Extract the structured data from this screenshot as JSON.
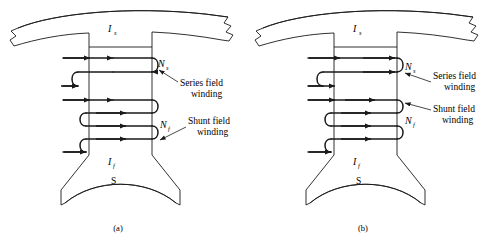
{
  "figure": {
    "type": "technical-diagram",
    "background_color": "#ffffff",
    "line_color": "#1a1a1a"
  },
  "panels": [
    {
      "id": "a",
      "caption": "(a)",
      "caption_x": 118,
      "caption_y": 231,
      "origin_x": 0,
      "labels": {
        "current_top": "I",
        "current_top_sub": "s",
        "current_bottom": "I",
        "current_bottom_sub": "f",
        "pole_letter": "S",
        "turns_series": "N",
        "turns_series_sub": "s",
        "turns_shunt": "N",
        "turns_shunt_sub": "f",
        "series_winding_line1": "Series field",
        "series_winding_line2": "winding",
        "shunt_winding_line1": "Shunt field",
        "shunt_winding_line2": "winding"
      },
      "arrow_directions": {
        "series_coils": [
          "right",
          "right"
        ],
        "series_leads": [
          "right",
          "left"
        ],
        "shunt_coils": [
          "right",
          "right",
          "right",
          "right"
        ],
        "shunt_leads": [
          "right",
          "left"
        ]
      }
    },
    {
      "id": "b",
      "caption": "(b)",
      "caption_x": 363,
      "caption_y": 231,
      "origin_x": 245,
      "labels": {
        "current_top": "I",
        "current_top_sub": "s",
        "current_bottom": "I",
        "current_bottom_sub": "f",
        "pole_letter": "S",
        "turns_series": "N",
        "turns_series_sub": "s",
        "turns_shunt": "N",
        "turns_shunt_sub": "f",
        "series_winding_line1": "Series field",
        "series_winding_line2": "winding",
        "shunt_winding_line1": "Shunt field",
        "shunt_winding_line2": "winding"
      },
      "arrow_directions": {
        "series_coils": [
          "left",
          "left"
        ],
        "series_leads": [
          "left",
          "right"
        ],
        "shunt_coils": [
          "right",
          "right",
          "right",
          "right"
        ],
        "shunt_leads": [
          "right",
          "left"
        ]
      }
    }
  ],
  "geometry": {
    "pole_left_x": 89,
    "pole_right_x": 152,
    "pole_top_y": 47,
    "pole_flare_y": 155,
    "shoe_bottom_y": 205,
    "coil_rows_y": [
      58,
      72,
      86,
      100,
      113,
      126,
      139
    ],
    "yoke_arc_note": "curved stator yoke band with jagged break ends at both sides"
  }
}
